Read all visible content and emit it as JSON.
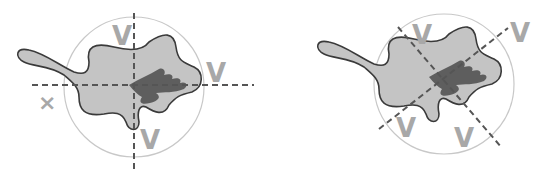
{
  "colors": {
    "blob_fill": "#c4c4c4",
    "blob_stroke": "#3a3a3a",
    "inner_fill": "#5e5e5e",
    "circle": "#c8c8c8",
    "dash": "#555555",
    "mark": "#a8a8a8"
  },
  "panels": [
    {
      "name": "left-panel",
      "axes": "horizontal-vertical",
      "marks": [
        {
          "label": "V",
          "position": "top"
        },
        {
          "label": "V",
          "position": "right"
        },
        {
          "label": "V",
          "position": "bottom"
        },
        {
          "label": "×",
          "position": "left"
        }
      ]
    },
    {
      "name": "right-panel",
      "axes": "diagonal",
      "marks": [
        {
          "label": "V",
          "position": "top-left"
        },
        {
          "label": "V",
          "position": "top-right"
        },
        {
          "label": "V",
          "position": "bottom-left"
        },
        {
          "label": "V",
          "position": "bottom-right"
        }
      ]
    }
  ]
}
